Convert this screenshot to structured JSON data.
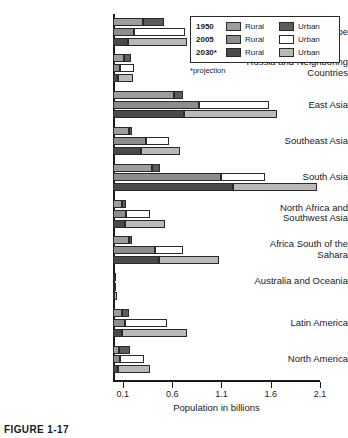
{
  "chart_data": {
    "type": "bar",
    "orientation": "horizontal",
    "stacked": true,
    "title": "",
    "xlabel": "Population in billions",
    "ylabel": "",
    "xlim": [
      0.0,
      2.1
    ],
    "xticks": [
      0.1,
      0.6,
      1.1,
      1.6,
      2.1
    ],
    "xticklabels": [
      "0.1",
      "0.6",
      "1.1",
      "1.6",
      "2.1"
    ],
    "grid": false,
    "legend_position": "top-right",
    "legend_note": "*projection",
    "legend": [
      {
        "year": "1950",
        "rural_label": "Rural",
        "urban_label": "Urban",
        "rural_color": "#9d9d9d",
        "urban_color": "#5c5c5c"
      },
      {
        "year": "2005",
        "rural_label": "Rural",
        "urban_label": "Urban",
        "rural_color": "#8d8d8d",
        "urban_color": "#ffffff"
      },
      {
        "year": "2030*",
        "rural_label": "Rural",
        "urban_label": "Urban",
        "rural_color": "#4a4a4a",
        "urban_color": "#b9b9b9"
      }
    ],
    "categories": [
      "Europe",
      "Russia and Neighboring Countries",
      "East Asia",
      "Southeast Asia",
      "South Asia",
      "North Africa and Southwest Asia",
      "Africa South of the Sahara",
      "Australia and Oceania",
      "Latin America",
      "North America"
    ],
    "series": [
      {
        "name": "1950 Rural",
        "values": [
          0.3,
          0.11,
          0.62,
          0.16,
          0.4,
          0.09,
          0.16,
          0.01,
          0.09,
          0.06
        ]
      },
      {
        "name": "1950 Urban",
        "values": [
          0.22,
          0.07,
          0.09,
          0.03,
          0.08,
          0.04,
          0.03,
          0.01,
          0.07,
          0.11
        ]
      },
      {
        "name": "2005 Rural",
        "values": [
          0.21,
          0.07,
          0.87,
          0.33,
          1.1,
          0.13,
          0.43,
          0.01,
          0.12,
          0.07
        ]
      },
      {
        "name": "2005 Urban",
        "values": [
          0.52,
          0.14,
          0.71,
          0.24,
          0.44,
          0.25,
          0.28,
          0.02,
          0.43,
          0.24
        ]
      },
      {
        "name": "2030* Rural",
        "values": [
          0.15,
          0.05,
          0.72,
          0.28,
          1.22,
          0.12,
          0.47,
          0.01,
          0.09,
          0.05
        ]
      },
      {
        "name": "2030* Urban",
        "values": [
          0.6,
          0.15,
          0.94,
          0.4,
          0.85,
          0.41,
          0.61,
          0.03,
          0.66,
          0.33
        ]
      }
    ]
  },
  "figure": {
    "caption": "FIGURE 1-17"
  }
}
